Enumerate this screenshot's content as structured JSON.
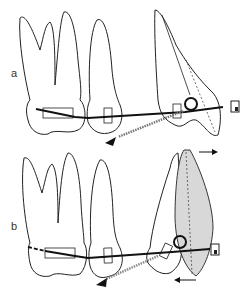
{
  "figure": {
    "type": "orthodontic tooth diagram",
    "panels": [
      {
        "label": "a",
        "description": "Canine tipped mesially with loop and elastic pulling distally"
      },
      {
        "label": "b",
        "description": "Canine uprighted (shaded), arrows indicating crown movement and root movement"
      }
    ],
    "colors": {
      "outline": "#222222",
      "wire": "#1a1a1a",
      "shade": "#d8d8d8",
      "background": "#ffffff"
    },
    "arrows": {
      "panel_b_top": "right",
      "panel_b_bottom": "left"
    }
  }
}
